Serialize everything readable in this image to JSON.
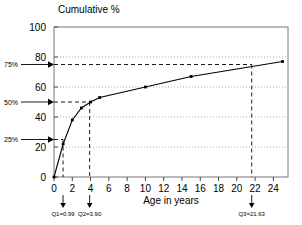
{
  "chart_data": {
    "type": "line",
    "title": "Cumulative %",
    "xlabel": "Age in years",
    "ylabel": "",
    "xlim": [
      0,
      25.6
    ],
    "ylim": [
      0,
      100
    ],
    "grid": true,
    "legend": "none",
    "x_ticks": [
      0,
      2,
      4,
      6,
      8,
      10,
      12,
      14,
      16,
      18,
      20,
      22,
      24
    ],
    "x_tick_labels": [
      "0",
      "2",
      "4",
      "6",
      "8",
      "10",
      "12",
      "14",
      "16",
      "18",
      "20",
      "22",
      "24"
    ],
    "y_ticks": [
      0,
      20,
      40,
      60,
      80,
      100
    ],
    "y_tick_labels": [
      "0",
      "20",
      "40",
      "60",
      "80",
      "100"
    ],
    "series": [
      {
        "name": "Cumulative percentage",
        "x": [
          0,
          1,
          2,
          3,
          4,
          5,
          10,
          15,
          25
        ],
        "values": [
          0,
          22,
          38,
          46,
          50,
          53,
          60,
          67,
          77
        ]
      }
    ],
    "percentile_markers": [
      {
        "label": "25%",
        "y": 25
      },
      {
        "label": "50%",
        "y": 50
      },
      {
        "label": "75%",
        "y": 75
      }
    ],
    "quartiles": [
      {
        "name": "Q1",
        "label": "Q1=0.99",
        "x": 0.99,
        "y": 25
      },
      {
        "name": "Q2",
        "label": "Q2=3.90",
        "x": 3.9,
        "y": 50
      },
      {
        "name": "Q3",
        "label": "Q3=21.63",
        "x": 21.63,
        "y": 75
      }
    ],
    "colors": {
      "line": "#000000",
      "marker": "#000000",
      "grid": "#999999",
      "axis": "#666666",
      "guide": "#000000"
    }
  }
}
